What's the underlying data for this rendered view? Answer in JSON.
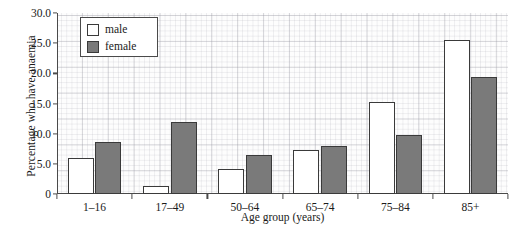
{
  "chart_data": {
    "type": "bar",
    "title": "",
    "xlabel": "Age group (years)",
    "ylabel": "Percentage who have anaemia",
    "categories": [
      "1–16",
      "17–49",
      "50–64",
      "65–74",
      "75–84",
      "85+"
    ],
    "series": [
      {
        "name": "male",
        "color": "#ffffff",
        "values": [
          5.9,
          1.4,
          4.2,
          7.3,
          15.2,
          25.5
        ]
      },
      {
        "name": "female",
        "color": "#7a7a7a",
        "values": [
          8.6,
          12.0,
          6.4,
          8.0,
          9.8,
          19.4
        ]
      }
    ],
    "ylim": [
      0,
      30
    ],
    "ytick_values": [
      0,
      5,
      10,
      15,
      20,
      25,
      30
    ],
    "ytick_labels": [
      "0",
      "5.0",
      "10.0",
      "15.0",
      "20.0",
      "25.0",
      "30.0"
    ],
    "grid": true,
    "legend_position": "top-left"
  },
  "legend": {
    "entries": [
      {
        "label": "male"
      },
      {
        "label": "female"
      }
    ]
  }
}
